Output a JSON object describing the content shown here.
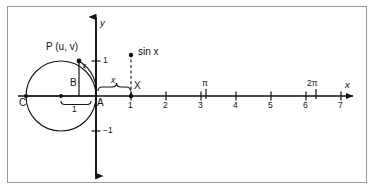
{
  "figure": {
    "border_color": "#9a9a9a",
    "ink_color": "#111111"
  },
  "axes": {
    "x_axis_label": "x",
    "y_axis_label": "y",
    "origin_label": "A",
    "x_tick_labels": [
      "1",
      "2",
      "3",
      "4",
      "5",
      "6",
      "7"
    ],
    "x_tick_values": [
      1,
      2,
      3,
      4,
      5,
      6,
      7
    ],
    "y_tick_labels": [
      "1",
      "−1"
    ],
    "y_tick_values": [
      1,
      -1
    ],
    "pi_label": "π",
    "pi_value": 3.14159,
    "two_pi_label": "2π",
    "two_pi_value": 6.28319,
    "unit_pixels": 35,
    "origin_px": {
      "x": 96,
      "y": 96
    }
  },
  "circle": {
    "center_label": "C",
    "radius_label": "1",
    "radius_value": 1,
    "point_label": "P (u, v)",
    "point_u": "u",
    "point_v": "v",
    "foot_label": "B",
    "arc_label": "x",
    "center_px": {
      "x": 61,
      "y": 96
    },
    "radius_px": 35
  },
  "sine_marker": {
    "label": "sin x",
    "point_label": "X",
    "arc_length_label": "x",
    "x_px": 131,
    "top_px": 52
  }
}
